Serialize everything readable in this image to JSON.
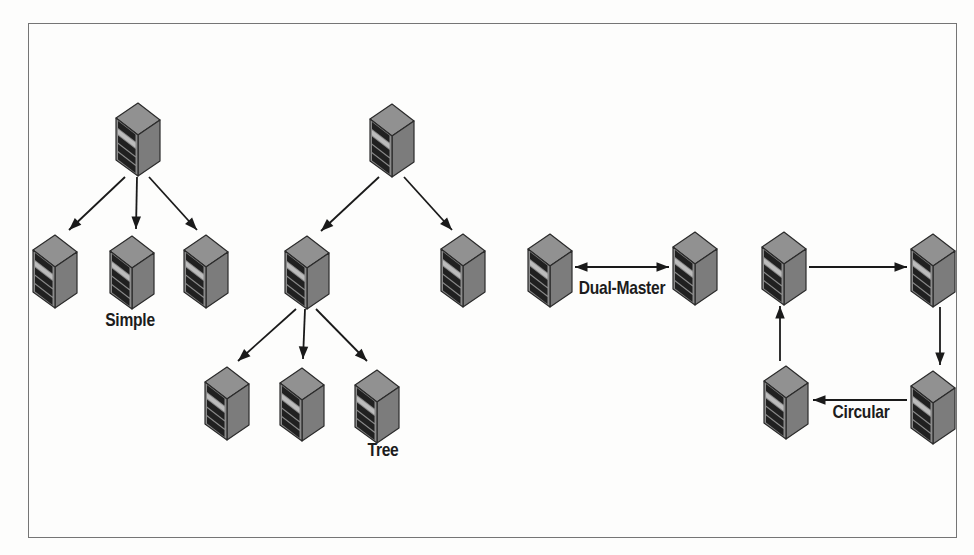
{
  "figure": {
    "background": "#fdfdfc",
    "frame": {
      "x": 28,
      "y": 23,
      "width": 929,
      "height": 515,
      "border_color": "#757575"
    },
    "arrow_color": "#1a1a1a",
    "label_color": "#1c1c1c",
    "server_icon_colors": {
      "top_face": "#919191",
      "side_face": "#7c7c7c",
      "front_face": "#8a8a8a",
      "bay": "#202020",
      "bay_highlight": "#bcbcbc",
      "outline": "#2b2b2b"
    },
    "topologies": [
      {
        "name": "simple",
        "label": "Simple",
        "label_center": {
          "x": 130,
          "y": 320
        },
        "servers": [
          {
            "x": 114,
            "y": 99
          },
          {
            "x": 31,
            "y": 231
          },
          {
            "x": 108,
            "y": 232
          },
          {
            "x": 182,
            "y": 231
          }
        ],
        "arrows": [
          {
            "x1": 125,
            "y1": 177,
            "x2": 69,
            "y2": 230,
            "heads": "end"
          },
          {
            "x1": 137,
            "y1": 177,
            "x2": 136,
            "y2": 229,
            "heads": "end"
          },
          {
            "x1": 149,
            "y1": 177,
            "x2": 197,
            "y2": 230,
            "heads": "end"
          }
        ]
      },
      {
        "name": "tree",
        "label": "Tree",
        "label_center": {
          "x": 383,
          "y": 450
        },
        "servers": [
          {
            "x": 368,
            "y": 100
          },
          {
            "x": 283,
            "y": 232
          },
          {
            "x": 439,
            "y": 230
          },
          {
            "x": 203,
            "y": 363
          },
          {
            "x": 278,
            "y": 364
          },
          {
            "x": 353,
            "y": 366
          }
        ],
        "arrows": [
          {
            "x1": 379,
            "y1": 177,
            "x2": 321,
            "y2": 231,
            "heads": "end"
          },
          {
            "x1": 404,
            "y1": 177,
            "x2": 452,
            "y2": 230,
            "heads": "end"
          },
          {
            "x1": 296,
            "y1": 309,
            "x2": 238,
            "y2": 361,
            "heads": "end"
          },
          {
            "x1": 305,
            "y1": 309,
            "x2": 303,
            "y2": 359,
            "heads": "end"
          },
          {
            "x1": 316,
            "y1": 309,
            "x2": 367,
            "y2": 361,
            "heads": "end"
          }
        ]
      },
      {
        "name": "dual-master",
        "label": "Dual-Master",
        "label_center": {
          "x": 622,
          "y": 288
        },
        "servers": [
          {
            "x": 526,
            "y": 230
          },
          {
            "x": 671,
            "y": 228
          }
        ],
        "arrows": [
          {
            "x1": 575,
            "y1": 267,
            "x2": 669,
            "y2": 267,
            "heads": "both"
          }
        ]
      },
      {
        "name": "circular",
        "label": "Circular",
        "label_center": {
          "x": 861,
          "y": 412
        },
        "servers": [
          {
            "x": 760,
            "y": 228
          },
          {
            "x": 909,
            "y": 230
          },
          {
            "x": 762,
            "y": 362
          },
          {
            "x": 909,
            "y": 367
          }
        ],
        "arrows": [
          {
            "x1": 809,
            "y1": 267,
            "x2": 907,
            "y2": 267,
            "heads": "end"
          },
          {
            "x1": 940,
            "y1": 307,
            "x2": 940,
            "y2": 365,
            "heads": "end"
          },
          {
            "x1": 907,
            "y1": 400,
            "x2": 813,
            "y2": 400,
            "heads": "end"
          },
          {
            "x1": 780,
            "y1": 361,
            "x2": 780,
            "y2": 306,
            "heads": "end"
          }
        ]
      }
    ]
  }
}
